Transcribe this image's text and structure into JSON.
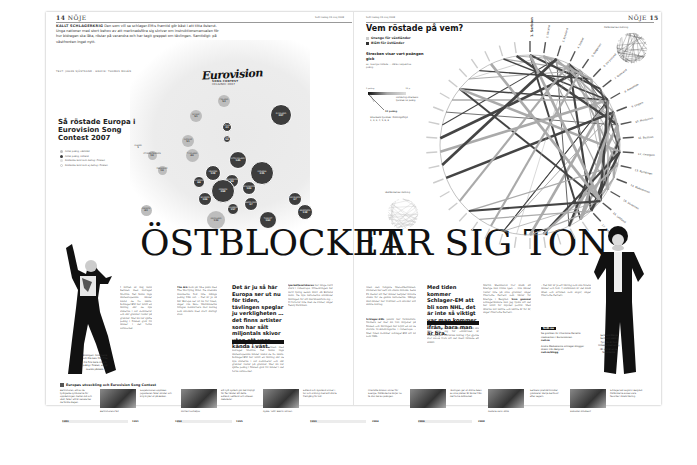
{
  "left_page": {
    "folio_number": "14",
    "section": "NÖJE",
    "dateline": "SvD fredag 23 maj 2008",
    "kicker_lead": "KALLT SCHLAGERKRIG",
    "kicker_text": "Den som vill se schlager-EM:s framtid gör bäst i att titta österut. Unga nationer med stort behov av att marknadsföra sig skriver om instruktionsmanualen för hur bidragen ska låta, röstar på varandra och har tagit greppet om tävlingen. Samtidigt: på västfronten inget nytt.",
    "byline": "TEXT: JOHAN SJÖSTRAND · GRAFIK: THOMAS MOLÉN",
    "map_logo": "Eurovision",
    "map_logo_sub": "SONG CONTEST",
    "map_logo_sub2": "HELSINKI 2007",
    "map_title": "Så röstade Europa i Eurovision Song Contest 2007",
    "legend": [
      {
        "label": "Antal poäng, väststat",
        "swatch": "#bdbdbd"
      },
      {
        "label": "Antal poäng, östland",
        "swatch": "#3d3d3d"
      },
      {
        "label": "Röstande land som deltog i finalen",
        "swatch": "#e0e0e0"
      },
      {
        "label": "Röstande land som ej deltog i finalen",
        "swatch": "#ffffff"
      }
    ],
    "headline": "ÖSTBLOCKET",
    "photo_caption": "Ensingen: Anna-Lena och Ola Salo från The Ark fick bara cirka 5 poäng i finalen, enligt svensk påskalk."
  },
  "map_bubbles": [
    {
      "name": "ISLAND",
      "value": "1",
      "type": "west-out",
      "x": 138,
      "y": 147,
      "d": 7
    },
    {
      "name": "STORBRITANNIEN",
      "value": "19",
      "type": "west",
      "x": 152,
      "y": 155,
      "d": 9
    },
    {
      "name": "FRANKRIKE",
      "value": "19",
      "type": "west",
      "x": 162,
      "y": 170,
      "d": 9
    },
    {
      "name": "NORGE",
      "value": "51",
      "type": "west",
      "x": 196,
      "y": 116,
      "d": 12
    },
    {
      "name": "FINLAND",
      "value": "53",
      "type": "west",
      "x": 224,
      "y": 101,
      "d": 12
    },
    {
      "name": "SVERIGE",
      "value": "51",
      "type": "west",
      "x": 188,
      "y": 141,
      "d": 12
    },
    {
      "name": "RYSSLAND",
      "value": "207",
      "type": "east",
      "x": 281,
      "y": 115,
      "d": 22
    },
    {
      "name": "ESTLAND",
      "value": "33",
      "type": "east",
      "x": 227,
      "y": 127,
      "d": 10
    },
    {
      "name": "LETTLAND",
      "value": "54",
      "type": "east",
      "x": 227,
      "y": 139,
      "d": 8
    },
    {
      "name": "VITRYSSLAND",
      "value": "145",
      "type": "east",
      "x": 238,
      "y": 160,
      "d": 18
    },
    {
      "name": "UKRAINA",
      "value": "235",
      "type": "east",
      "x": 262,
      "y": 173,
      "d": 24
    },
    {
      "name": "UNGERN",
      "value": "128",
      "type": "east",
      "x": 213,
      "y": 173,
      "d": 16
    },
    {
      "name": "SLOVENIEN",
      "value": "66",
      "type": "east",
      "x": 199,
      "y": 182,
      "d": 12
    },
    {
      "name": "RUMÄNIEN",
      "value": "84",
      "type": "east",
      "x": 232,
      "y": 181,
      "d": 14
    },
    {
      "name": "SERBIEN",
      "value": "268",
      "type": "east",
      "x": 223,
      "y": 191,
      "d": 24
    },
    {
      "name": "MOLDAVIEN",
      "value": "109",
      "type": "east",
      "x": 249,
      "y": 188,
      "d": 14
    },
    {
      "name": "MAKEDONIEN",
      "value": "97",
      "type": "east",
      "x": 251,
      "y": 204,
      "d": 14
    },
    {
      "name": "BOSNIEN",
      "value": "106",
      "type": "east",
      "x": 205,
      "y": 199,
      "d": 14
    },
    {
      "name": "BULGARIEN",
      "value": "157",
      "type": "east",
      "x": 233,
      "y": 209,
      "d": 12
    },
    {
      "name": "GREKLAND",
      "value": "139",
      "type": "west",
      "x": 216,
      "y": 220,
      "d": 18
    },
    {
      "name": "TURKIET",
      "value": "163",
      "type": "east",
      "x": 268,
      "y": 220,
      "d": 18
    },
    {
      "name": "GEORGIEN",
      "value": "97",
      "type": "east",
      "x": 295,
      "y": 199,
      "d": 14
    },
    {
      "name": "ARMENIEN",
      "value": "138",
      "type": "east",
      "x": 305,
      "y": 212,
      "d": 16
    },
    {
      "name": "SPANIEN",
      "value": "43",
      "type": "west",
      "x": 146,
      "y": 210,
      "d": 11
    },
    {
      "name": "TYSKLAND",
      "value": "49",
      "type": "west",
      "x": 192,
      "y": 155,
      "d": 13
    }
  ],
  "left_columns": {
    "col1": "I mitten av maj vann Serbien med bidraget Molitva. Det fanns inga västeuropeiska länder bland de tio bästa. Schlager-EM har blivit en tävling där de nya staterna i öst dominerar och där grannar röstar på grannar. Mer än var sjätte poäng i finalen gick till länder i det forna östblocket.",
    "col2_lead": "The Ark",
    "col2": "kom på 18:e plats med The Worrying Kind. De svenska musikerna fick inte många poäng från öst. – Det är ju så här Europa ser ut nu för tiden, säger Ola Salo. Västländerna tvingas konkurrera mot bidrag som skickats med stort statligt stöd.",
    "col3_lead": "Iparkettesatsbaren",
    "col3": "har länge varit stark i Östeuropa. Utvecklingen har varit tydlig sedan 2001 då Estland vann. De nya nationerna använder tävlingen för att marknadsföra sig. – Vi förlorar inte men de vinner, säger Teddy Parkman."
  },
  "pull_quote_left": "Det är ju så här Europa ser ut nu för tiden, tävlingen speglar ju verkligheten … det finns artister som har sålt miljontals skivor utan att vara kända i väst.",
  "right_page": {
    "folio_number": "15",
    "section": "NÖJE",
    "dateline": "SvD fredag 23 maj 2008",
    "chart_title": "Vem röstade på vem?",
    "legend_orange": "Orange för västländer",
    "legend_black": "Blått för östländer",
    "sub_title": "Strecken visar vart poängen gick",
    "sub_note": "ex. Sverige röstade ... därav respektive poäng",
    "scale_low": "1 poäng",
    "scale_high": "12 p",
    "scale_note": "Förklaring streckens tjocklek 12 poäng",
    "scale_12": "12 poäng",
    "scale_order": "Streckens tjocklek: Ordningsföljd 1, 2, 3, 4, 5, 6, 8",
    "mini_left_title": "Västländernas röstning",
    "mini_right_title": "Östländernas röstning",
    "headline": "TAR SIG TON",
    "photo_caption": "Serbiens Marija Šerifović vann i fjol. Nu är hon tillbaka med en ny låt och är en av favoriterna."
  },
  "chart_data": {
    "type": "chord",
    "title": "Vem röstade på vem?",
    "labels": [
      "1. Serbien",
      "2. Ukraina",
      "3. Ryssland",
      "4. Turkiet",
      "5. Bulgarien",
      "6. Vitryssland",
      "7. Grekland",
      "8. Armenien",
      "9. Ungern",
      "10. Moldavien",
      "11. Bosnien",
      "12. Georgien",
      "13. Rumänien",
      "14. Makedonien",
      "15. Slovenien",
      "16. Lettland",
      "17. Schweiz"
    ],
    "legend": [
      "Västländer (orange)",
      "Östländer (svart)"
    ],
    "note": "Strecken visar vart poängen gick; tjocklek = antal poäng (1–12)"
  },
  "right_columns": {
    "col1": "Även den tidigare Melodifestivalen-vinnaren har sett sin chans minska. Lena Ph menar att fler länder betyder mindre chans för de gamla nationerna. Många väst-länder har tröttnat och skickar allt sämre bidrag.",
    "col1_lead": "Schlager-EMs",
    "col1b": "publik har förändrats. Numera ser mer än 100 miljoner på finalen och tävlingen har blivit en av de största tv-sändningarna i Östeuropa. – Med tiden kommer schlager-EM att bli som NHL.",
    "col2": "Ett av de nya länderna i tävlingen som ska visa upp sig för omvärlden är Azerbajdzjan. Ukrainas bidrag i fjol gjorde stor succé trots att det mest liknade ett skämt.",
    "col3": "Martin Stenmarck tror ändå att Sverige kan vinna igen. – Alla länder röstar inte på sina grannar, säger Charlotte Perrelli som tävlar för Sverige i Belgrad.",
    "col3_lead": "Som gammal",
    "col3b": "schlagerälskare kan jag tycka att det har blivit för mycket politik. Men låtarna blir bättre och bättre år för år, säger Charlotte Perrelli.",
    "col4": "– Det här är ju ett tävling som ska förena länder och folk. I slutändan är det ändå låten och artisten som avgör, säger Charlotte Perrelli."
  },
  "pull_quote_right": "Med tiden kommer Schlager-EM att bli som NHL, det är inte så viktigt var man kommer ifrån, bara man är bra.",
  "factbox": {
    "head": "SvD.se",
    "text1": "Se grafiken för Charlotte Perrellis medverkan i Eurovisionen",
    "link1": "svd.se",
    "text2": "Andra Medvetanta schlager-bloggar direkt från Belgrad",
    "link2": "svd.se/blogg"
  },
  "timeline": {
    "title": "Europas utveckling och Eurovision Song Contest",
    "entries": [
      {
        "text": "Berlinmuren, ett av de tydligaste symbolerna för uppdelningen mellan öst och väst, faller. Ett år senare tas de första stegen.",
        "caption": "Berlinmurens fall"
      },
      {
        "text": "Sovjetunionen upplöses. Jugoslavien faller sönder och krig bryter ut på Balkan.",
        "caption": "Michail Gorbatjov"
      },
      {
        "text": "Ett nytt system gör det möjligt för fler länder att delta. Estland, Lettland och Litauen debuterar.",
        "caption": "Ryska 'Tutti' Bakrin Ulricen"
      },
      {
        "text": "Estland och Ryssland vinner i tur och ordning med allt större framgång för öst.",
        "caption": ""
      },
      {
        "text": "Charlotte Nilsson vinner för Sverige. Östländerna börjar nu ta stor del av poängen.",
        "caption": ""
      },
      {
        "text": "Tävlingen ger ut större delen av sina platser åt länder från det forna östblocket.",
        "caption": "Ruslana vann 2004"
      },
      {
        "text": "Serbiens premiärminister gratulerar Marija Šerifović efter segern.",
        "caption": "Slobodan Milošević"
      },
      {
        "text": "Schlager-EM avgörs i Belgrad. Östländerna anses vara favoriter i årets tävling.",
        "caption": "Charlotte Perrelli"
      }
    ],
    "years": [
      "1989",
      "1991",
      "1994",
      "1995",
      "1999",
      "2004",
      "2006",
      "2008"
    ]
  },
  "colors": {
    "east": "#3d3d3d",
    "west": "#bdbdbd",
    "text": "#222222",
    "rule": "#999999"
  }
}
